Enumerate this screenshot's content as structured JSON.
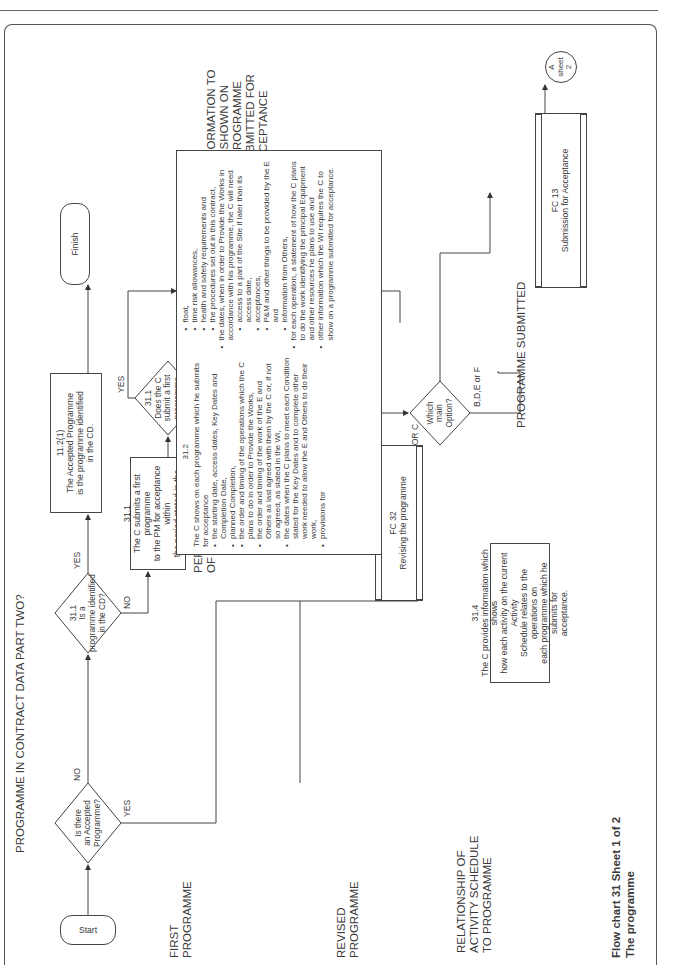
{
  "page": {
    "orientation": "rotated-90-ccw",
    "caption_line1": "Flow chart 31   Sheet 1 of 2",
    "caption_line2": "The programme"
  },
  "section_labels": {
    "programme_in_cd": "PROGRAMME IN CONTRACT DATA PART TWO?",
    "first_programme": "FIRST\nPROGRAMME",
    "period_for_submission": "PERIOD FOR SUBMISSION\nOF A FIRST PROGRAMME",
    "retain_quarter": "RETAIN ONE QUARTER OF\nPAYMENT UNTIL A FIRST\nPROGRAMME SUBMITTED",
    "information_to_be_shown": "INFORMATION TO\nBE SHOWN ON\nA PROGRAMME\nSUBMITTED FOR\nACCEPTANCE",
    "revised_programme": "REVISED\nPROGRAMME",
    "relationship": "RELATIONSHIP OF\nACTIVITY SCHEDULE\nTO PROGRAMME",
    "programme_submitted": "PROGRAMME SUBMITTED"
  },
  "nodes": {
    "start": {
      "label": "Start"
    },
    "finish": {
      "label": "Finish"
    },
    "d_accepted": {
      "lines": [
        "Is there",
        "an Accepted",
        "Programme?"
      ]
    },
    "d_identified": {
      "lines": [
        "31.1",
        "Is a",
        "programme identified",
        "in the CD?"
      ]
    },
    "d_in_time": {
      "lines": [
        "31.1",
        "Does the C",
        "submit a first",
        "programme",
        "in time?"
      ]
    },
    "d_option": {
      "lines": [
        "Which",
        "main",
        "Option?"
      ]
    },
    "box_11_2": {
      "ref": "11.2(1)",
      "lines": [
        "The Accepted Programme",
        "is the programme identified",
        "in the CD."
      ]
    },
    "box_31_1": {
      "ref": "31.1",
      "lines": [
        "The C submits a first programme",
        "to the PM for acceptance within",
        "the period stated in the CD."
      ]
    },
    "fc50": {
      "ref": "FC 50",
      "lines": [
        "Assessing the amount",
        "due, including 50.3"
      ]
    },
    "fc32": {
      "ref": "FC 32",
      "lines": [
        "Revising the programme"
      ]
    },
    "fc13": {
      "ref": "FC 13",
      "lines": [
        "Submission for Acceptance"
      ]
    },
    "box_31_4": {
      "ref": "31.4",
      "lines": [
        "The C provides information which shows",
        "how each activity on the current Activity",
        "Schedule relates to the operations on",
        "each programme which he submits for",
        "acceptance."
      ]
    },
    "connector_a": {
      "lines": [
        "A",
        "sheet",
        "2"
      ]
    }
  },
  "box_31_2": {
    "ref": "31.2",
    "intro": "The C shows on each programme which he submits for acceptance",
    "items": [
      "the starting date, access dates, Key Dates and Completion Date,",
      "planned Completion,",
      "the order and timing of the operations which the C plans to do in order to Provide the Works,",
      "the order and timing of the work of the E and Others as last agreed with them by the C or, if not so agreed, as stated in the WI,",
      "the dates when the C plans to meet each Condition stated for the Key Dates and to complete other work needed to allow the E and Others to do their work,",
      "provisions for"
    ],
    "provisions": [
      "float,",
      "time risk allowances,",
      "health and safety requirements and",
      "the procedures set out in this contract,"
    ],
    "items2": [
      "the dates, when in order to Provide the Works in accordance with his programme, the C will need"
    ],
    "needs": [
      "access to a part of the Site if later than its access date,",
      "acceptances,",
      "P&M and other things to be provided by the E and",
      "information from Others,"
    ],
    "items3": [
      "for each operation, a statement of how the C plans to do the work identifying the principal Equipment and other resources he plans to use and",
      "other information which the WI requires the C to show on a programme submitted for acceptance."
    ]
  },
  "edge_labels": {
    "accepted_no": "NO",
    "accepted_yes": "YES",
    "identified_yes": "YES",
    "identified_no": "NO",
    "in_time_yes": "YES",
    "in_time_no": "NO",
    "option_bdef": "B,D,E or F",
    "option_ac": "A OR C"
  }
}
